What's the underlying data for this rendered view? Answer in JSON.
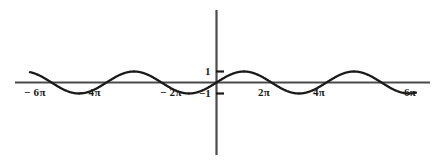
{
  "figure": {
    "background_color": "#ffffff",
    "axis_color": "#3d3d3d",
    "curve_color": "#1a1a1a",
    "width": 442,
    "height": 163
  },
  "axes": {
    "x_axis_name": "x-axis",
    "y_axis_name": "y-axis",
    "origin_x": 216,
    "origin_y": 82,
    "x_start": 15,
    "x_end": 430,
    "y_start": 10,
    "y_end": 155
  },
  "x_ticks": [
    {
      "label_minus": "−",
      "label_value": "6",
      "label_pi": "π",
      "text": "− 6π",
      "value": -18.8496,
      "px": 51
    },
    {
      "label_minus": "−",
      "label_value": "4",
      "label_pi": "π",
      "text": "− 4π",
      "value": -12.5664,
      "px": 106
    },
    {
      "label_minus": "−",
      "label_value": "2",
      "label_pi": "π",
      "text": "− 2π",
      "value": -6.2832,
      "px": 161
    },
    {
      "label_minus": "",
      "label_value": "2",
      "label_pi": "π",
      "text": "2π",
      "value": 6.2832,
      "px": 271
    },
    {
      "label_minus": "",
      "label_value": "4",
      "label_pi": "π",
      "text": "4π",
      "value": 12.5664,
      "px": 326
    },
    {
      "label_minus": "",
      "label_value": "6",
      "label_pi": "π",
      "text": "6π",
      "value": 18.8496,
      "px": 381
    }
  ],
  "y_ticks": [
    {
      "text": "1",
      "value": 1,
      "px": 71
    },
    {
      "text": "−1",
      "value": -1,
      "px": 93
    }
  ],
  "chart_data": {
    "type": "line",
    "title": "",
    "xlabel": "",
    "ylabel": "",
    "function": "y = sin x",
    "amplitude": 1,
    "period": 6.2832,
    "xlim": [
      -20.4,
      20.4
    ],
    "ylim": [
      -1.6,
      1.6
    ],
    "grid": false,
    "legend": null,
    "x_tick_labels": [
      "− 6π",
      "− 4π",
      "− 2π",
      "2π",
      "4π",
      "6π"
    ],
    "x_tick_values": [
      -18.8496,
      -12.5664,
      -6.2832,
      6.2832,
      12.5664,
      18.8496
    ],
    "y_tick_labels": [
      "1",
      "−1"
    ],
    "y_tick_values": [
      1,
      -1
    ],
    "series": [
      {
        "name": "sin x",
        "color": "#1a1a1a",
        "x": [
          -19.5,
          -18.8496,
          -17.2788,
          -15.708,
          -14.1372,
          -12.5664,
          -10.9956,
          -9.4248,
          -7.854,
          -6.2832,
          -4.7124,
          -3.1416,
          -1.5708,
          0,
          1.5708,
          3.1416,
          4.7124,
          6.2832,
          7.854,
          9.4248,
          10.9956,
          12.5664,
          14.1372,
          15.708,
          17.2788,
          18.8496,
          19.5
        ],
        "y": [
          -0.6052,
          0,
          1,
          0,
          -1,
          0,
          1,
          0,
          -1,
          0,
          1,
          0,
          -1,
          0,
          1,
          0,
          -1,
          0,
          1,
          0,
          -1,
          0,
          1,
          0,
          -1,
          0,
          0.6052
        ]
      }
    ]
  }
}
